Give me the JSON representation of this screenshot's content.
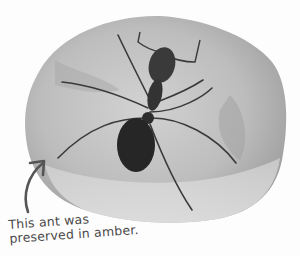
{
  "image": {
    "subject": "ant preserved in amber",
    "caption_lines": [
      "This ant was",
      "preserved in amber."
    ],
    "colors": {
      "amber_light": "#d6d6d6",
      "amber_mid": "#b5b5b5",
      "amber_dark": "#8e8e8e",
      "ant": "#2b2b2b",
      "caption": "#4a4a4a",
      "arrow": "#555555"
    }
  }
}
